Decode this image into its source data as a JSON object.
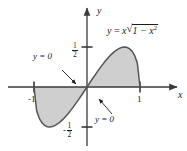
{
  "figure": {
    "title": "",
    "background_color": "#ffffff",
    "curve_color": "#555555",
    "shade_color": "#cfcfcf",
    "axis_color": "#3a3a3a",
    "text_color": "#1a1a1a"
  },
  "axes": {
    "x_label": "x",
    "y_label": "y",
    "x_ticks": [
      {
        "value": -1,
        "label": "-1",
        "px": 34
      },
      {
        "value": 1,
        "label": "1",
        "px": 140
      }
    ],
    "y_ticks": [
      {
        "value": 0.5,
        "label_num": "1",
        "label_den": "2",
        "sign": "",
        "py": 47
      },
      {
        "value": -0.5,
        "label_num": "1",
        "label_den": "2",
        "sign": "-",
        "py": 127
      }
    ],
    "origin_px": [
      87,
      87
    ],
    "x_unit_px": 53,
    "y_half_unit_px": 40
  },
  "annotations": [
    {
      "id": "equation",
      "lhs": "y",
      "equals": "=",
      "coef": "x",
      "radical": "√",
      "radicand_base": "1 − x",
      "radicand_exp": "2",
      "full_text": "y = x√(1 − x²)",
      "x": 107,
      "y": 30
    },
    {
      "id": "y-zero-left",
      "text": "y = 0",
      "x": 36,
      "y": 58,
      "arrow_from": [
        62,
        70
      ],
      "arrow_to": [
        76,
        84
      ]
    },
    {
      "id": "y-zero-right",
      "text": "y = 0",
      "x": 97,
      "y": 118,
      "arrow_from": [
        112,
        114
      ],
      "arrow_to": [
        99,
        99
      ]
    }
  ],
  "chart_data": {
    "type": "line",
    "title": "",
    "xlabel": "x",
    "ylabel": "y",
    "xlim": [
      -1.35,
      1.45
    ],
    "ylim": [
      -0.72,
      0.78
    ],
    "grid": false,
    "legend": "none",
    "function_label": "y = x√(1 − x²)",
    "shaded_regions": [
      {
        "from": -1,
        "to": 0,
        "description": "region between curve and x-axis, below axis"
      },
      {
        "from": 0,
        "to": 1,
        "description": "region between curve and x-axis, above axis"
      }
    ],
    "zeros": [
      -1,
      0,
      1
    ],
    "extrema": [
      {
        "x": -0.7071,
        "y": -0.5,
        "type": "minimum"
      },
      {
        "x": 0.7071,
        "y": 0.5,
        "type": "maximum"
      }
    ],
    "x": [
      -1,
      -0.95,
      -0.9,
      -0.85,
      -0.8,
      -0.75,
      -0.7071,
      -0.65,
      -0.6,
      -0.55,
      -0.5,
      -0.45,
      -0.4,
      -0.35,
      -0.3,
      -0.25,
      -0.2,
      -0.15,
      -0.1,
      -0.05,
      0,
      0.05,
      0.1,
      0.15,
      0.2,
      0.25,
      0.3,
      0.35,
      0.4,
      0.45,
      0.5,
      0.55,
      0.6,
      0.65,
      0.7071,
      0.75,
      0.8,
      0.85,
      0.9,
      0.95,
      1
    ],
    "y": [
      0,
      -0.2966,
      -0.3923,
      -0.4477,
      -0.48,
      -0.4961,
      -0.5,
      -0.4938,
      -0.48,
      -0.4593,
      -0.433,
      -0.4019,
      -0.3666,
      -0.3278,
      -0.2862,
      -0.2421,
      -0.196,
      -0.1483,
      -0.0995,
      -0.0499,
      0,
      0.0499,
      0.0995,
      0.1483,
      0.196,
      0.2421,
      0.2862,
      0.3278,
      0.3666,
      0.4019,
      0.433,
      0.4593,
      0.48,
      0.4938,
      0.5,
      0.4961,
      0.48,
      0.4477,
      0.3923,
      0.2966,
      0
    ]
  }
}
